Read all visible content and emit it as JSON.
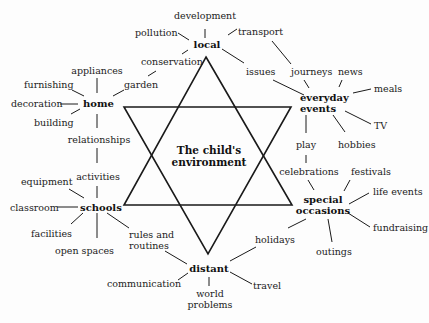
{
  "diagram": {
    "title": "The child's environment",
    "center": {
      "line1": "The child's",
      "line2": "environment"
    },
    "hubs": {
      "local": "local",
      "home": "home",
      "schools": "schools",
      "distant": "distant",
      "everyday_line1": "everyday",
      "everyday_line2": "events",
      "special_line1": "special",
      "special_line2": "occasions"
    },
    "local_topics": [
      "development",
      "pollution",
      "transport",
      "conservation",
      "issues"
    ],
    "home_topics": [
      "appliances",
      "furnishing",
      "garden",
      "decoration",
      "building",
      "relationships"
    ],
    "schools_topics": [
      "activities",
      "equipment",
      "classroom",
      "facilities",
      "open spaces",
      "rules and",
      "routines"
    ],
    "distant_topics": [
      "communication",
      "world",
      "problems",
      "travel",
      "holidays"
    ],
    "everyday_topics": [
      "journeys",
      "news",
      "meals",
      "TV",
      "hobbies",
      "play"
    ],
    "special_topics": [
      "celebrations",
      "festivals",
      "life events",
      "fundraising",
      "outings"
    ],
    "colors": {
      "line": "#1a1a1a",
      "text": "#222222",
      "background": "#fdfdfd"
    }
  }
}
